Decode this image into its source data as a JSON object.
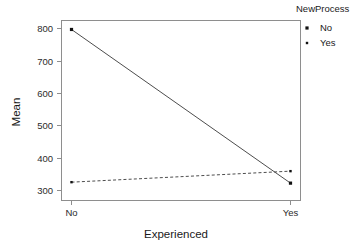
{
  "chart_data": {
    "type": "line",
    "title": "",
    "subtitle": "",
    "xlabel": "Experienced",
    "ylabel": "Mean",
    "categories": [
      "No",
      "Yes"
    ],
    "x_tick_labels": [
      "No",
      "Yes"
    ],
    "y_tick_labels": [
      "300",
      "400",
      "500",
      "600",
      "700",
      "800"
    ],
    "y_ticks": [
      300,
      400,
      500,
      600,
      700,
      800
    ],
    "ylim": [
      275,
      825
    ],
    "grid": false,
    "legend_position": "right",
    "legend_title": "NewProcess",
    "series": [
      {
        "name": "No",
        "values": [
          797,
          323
        ],
        "linestyle": "solid",
        "color": "#4d4d4d",
        "marker": "square",
        "marker_size": 3.2
      },
      {
        "name": "Yes",
        "values": [
          326,
          360
        ],
        "linestyle": "dashed",
        "color": "#4d4d4d",
        "marker": "square",
        "marker_size": 2.4
      }
    ],
    "annotations": []
  },
  "legend": {
    "title": "NewProcess",
    "entries": [
      {
        "label": "No",
        "marker": "square-marker-filled"
      },
      {
        "label": "Yes",
        "marker": "square-marker-small"
      }
    ]
  },
  "axes": {
    "x_title": "Experienced",
    "y_title": "Mean"
  },
  "colors": {
    "frame": "#8e8e8e",
    "line": "#4d4d4d",
    "marker": "#111111",
    "text": "#1a1a1a",
    "background": "#ffffff"
  }
}
